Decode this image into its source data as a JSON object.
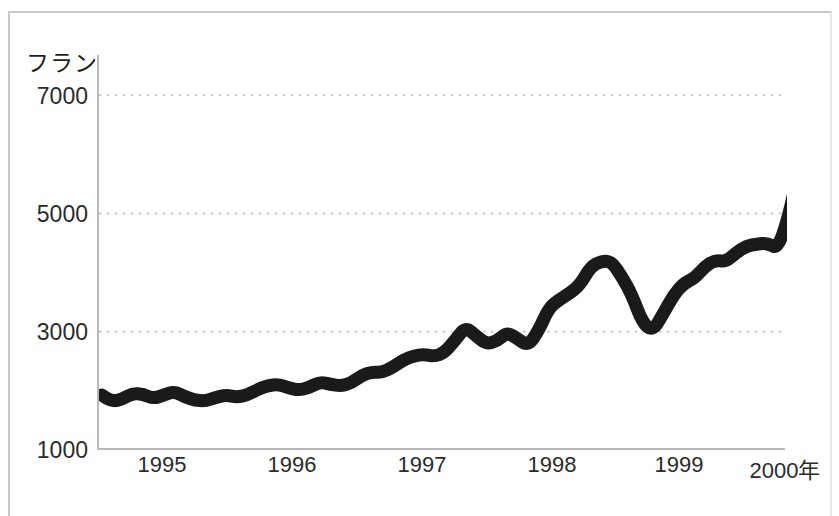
{
  "chart_data": {
    "type": "line",
    "title": "",
    "subtitle": "",
    "xlabel": "",
    "ylabel": "フラン",
    "unit_label": "フラン",
    "xlim": [
      1994.5,
      2000.15
    ],
    "ylim": [
      1000,
      7400
    ],
    "ytick_values": [
      7000,
      5000,
      3000,
      1000
    ],
    "ytick_labels": [
      "7000",
      "5000",
      "3000",
      "1000"
    ],
    "xtick_values": [
      1995,
      1996,
      1997,
      1998,
      1999,
      2000
    ],
    "xtick_labels": [
      "1995",
      "1996",
      "1997",
      "1998",
      "1999",
      "2000年"
    ],
    "grid": "horizontal-dotted",
    "grid_at": [
      7000,
      5000,
      3000
    ],
    "legend": "none",
    "line_color": "#1a1a1a",
    "grid_color": "#c4c4c4",
    "axis_color": "#b9b9b9",
    "background_color": "#ffffff",
    "series": [
      {
        "name": "フラン",
        "x": [
          1994.52,
          1994.6,
          1994.68,
          1994.76,
          1994.84,
          1994.92,
          1995.0,
          1995.08,
          1995.16,
          1995.24,
          1995.32,
          1995.4,
          1995.48,
          1995.56,
          1995.64,
          1995.72,
          1995.8,
          1995.88,
          1995.96,
          1996.04,
          1996.12,
          1996.2,
          1996.28,
          1996.36,
          1996.44,
          1996.52,
          1996.6,
          1996.68,
          1996.76,
          1996.84,
          1996.92,
          1997.0,
          1997.08,
          1997.16,
          1997.24,
          1997.32,
          1997.4,
          1997.48,
          1997.56,
          1997.64,
          1997.72,
          1997.8,
          1997.88,
          1997.96,
          1998.04,
          1998.12,
          1998.2,
          1998.28,
          1998.36,
          1998.44,
          1998.52,
          1998.6,
          1998.68,
          1998.76,
          1998.84,
          1998.92,
          1999.0,
          1999.08,
          1999.16,
          1999.24,
          1999.32,
          1999.4,
          1999.48,
          1999.56,
          1999.64,
          1999.72,
          1999.8,
          1999.88,
          1999.96,
          2000.02
        ],
        "y": [
          1930,
          1820,
          1860,
          1960,
          1940,
          1870,
          1930,
          1990,
          1900,
          1840,
          1830,
          1890,
          1930,
          1890,
          1930,
          2020,
          2090,
          2110,
          2050,
          2010,
          2060,
          2150,
          2110,
          2080,
          2130,
          2260,
          2320,
          2310,
          2400,
          2520,
          2590,
          2620,
          2580,
          2650,
          2860,
          3080,
          2930,
          2790,
          2840,
          2990,
          2880,
          2760,
          3010,
          3400,
          3540,
          3650,
          3790,
          4090,
          4190,
          4190,
          3940,
          3620,
          3150,
          3010,
          3300,
          3620,
          3820,
          3900,
          4100,
          4210,
          4180,
          4330,
          4450,
          4480,
          4500,
          4400,
          4900,
          5700,
          6130,
          6330
        ]
      }
    ],
    "annotations": []
  },
  "axis": {
    "unit_label": "フラン",
    "y_labels": [
      "7000",
      "5000",
      "3000",
      "1000"
    ],
    "x_labels": [
      "1995",
      "1996",
      "1997",
      "1998",
      "1999",
      "2000年"
    ]
  }
}
